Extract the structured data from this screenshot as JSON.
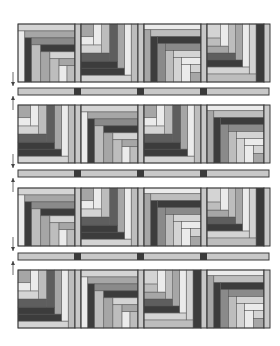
{
  "diagram": {
    "layout": {
      "rows": 4,
      "cols": 4,
      "origin_x": 18,
      "origin_y": 24,
      "block_w": 57,
      "block_h": 58,
      "side_sash_w": 6,
      "col_pitch": 63,
      "row_gap_sash_h": 7
    },
    "palette": {
      "c1": "#ebebeb",
      "c2": "#d4d4d4",
      "c3": "#bdbdbd",
      "c4": "#a6a6a6",
      "c5": "#8a8a8a",
      "c6": "#5e5e5e",
      "c7": "#3c3c3c",
      "sash": "#c8c8c8",
      "cornerstone": "#3a3a3a",
      "outline": "#3a3a3a"
    },
    "block_types": {
      "A": {
        "name": "stair-bottom-right",
        "strips": [
          [
            0,
            0,
            1,
            0.12,
            "c2"
          ],
          [
            0,
            0.12,
            0.12,
            0.88,
            "c1"
          ],
          [
            0.12,
            0.12,
            0.88,
            0.12,
            "c4"
          ],
          [
            0.12,
            0.24,
            0.12,
            0.76,
            "c7"
          ],
          [
            0.24,
            0.24,
            0.76,
            0.12,
            "c5"
          ],
          [
            0.24,
            0.36,
            0.16,
            0.64,
            "c3"
          ],
          [
            0.4,
            0.36,
            0.6,
            0.12,
            "c7"
          ],
          [
            0.4,
            0.48,
            0.16,
            0.52,
            "c4"
          ],
          [
            0.56,
            0.48,
            0.44,
            0.12,
            "c2"
          ],
          [
            0.56,
            0.6,
            0.16,
            0.4,
            "c3"
          ],
          [
            0.72,
            0.6,
            0.28,
            0.12,
            "c4"
          ],
          [
            0.72,
            0.72,
            0.14,
            0.28,
            "c1"
          ],
          [
            0.86,
            0.72,
            0.14,
            0.28,
            "c3"
          ]
        ]
      },
      "B": {
        "name": "stair-top-left",
        "strips": [
          [
            0.88,
            0,
            0.12,
            1,
            "c3"
          ],
          [
            0,
            0.88,
            0.88,
            0.12,
            "c2"
          ],
          [
            0.76,
            0,
            0.12,
            0.88,
            "c1"
          ],
          [
            0,
            0.76,
            0.76,
            0.12,
            "c7"
          ],
          [
            0.64,
            0,
            0.12,
            0.76,
            "c4"
          ],
          [
            0,
            0.64,
            0.64,
            0.12,
            "c7"
          ],
          [
            0.5,
            0,
            0.14,
            0.64,
            "c6"
          ],
          [
            0,
            0.5,
            0.5,
            0.14,
            "c6"
          ],
          [
            0.36,
            0,
            0.14,
            0.5,
            "c3"
          ],
          [
            0,
            0.36,
            0.36,
            0.14,
            "c2"
          ],
          [
            0.22,
            0,
            0.14,
            0.36,
            "c1"
          ],
          [
            0,
            0.22,
            0.22,
            0.14,
            "c1"
          ],
          [
            0,
            0,
            0.22,
            0.22,
            "c4"
          ]
        ]
      },
      "C": {
        "name": "stair-bottom-right-dark",
        "strips": [
          [
            0,
            0,
            1,
            0.1,
            "c1"
          ],
          [
            0,
            0.1,
            0.12,
            0.9,
            "c4"
          ],
          [
            0.12,
            0.1,
            0.88,
            0.12,
            "c3"
          ],
          [
            0.12,
            0.22,
            0.12,
            0.78,
            "c7"
          ],
          [
            0.24,
            0.22,
            0.76,
            0.12,
            "c7"
          ],
          [
            0.24,
            0.34,
            0.14,
            0.66,
            "c5"
          ],
          [
            0.38,
            0.34,
            0.62,
            0.12,
            "c5"
          ],
          [
            0.38,
            0.46,
            0.14,
            0.54,
            "c3"
          ],
          [
            0.52,
            0.46,
            0.48,
            0.12,
            "c2"
          ],
          [
            0.52,
            0.58,
            0.14,
            0.42,
            "c2"
          ],
          [
            0.66,
            0.58,
            0.34,
            0.12,
            "c1"
          ],
          [
            0.66,
            0.7,
            0.16,
            0.3,
            "c1"
          ],
          [
            0.82,
            0.7,
            0.18,
            0.14,
            "c2"
          ],
          [
            0.82,
            0.84,
            0.18,
            0.16,
            "c4"
          ]
        ]
      },
      "D": {
        "name": "stair-top-left-darkright",
        "strips": [
          [
            0.86,
            0,
            0.14,
            1,
            "c7"
          ],
          [
            0,
            0.86,
            0.86,
            0.14,
            "c3"
          ],
          [
            0.74,
            0,
            0.12,
            0.86,
            "c2"
          ],
          [
            0,
            0.74,
            0.74,
            0.12,
            "c2"
          ],
          [
            0.62,
            0,
            0.12,
            0.74,
            "c1"
          ],
          [
            0,
            0.62,
            0.62,
            0.12,
            "c7"
          ],
          [
            0.5,
            0,
            0.12,
            0.62,
            "c4"
          ],
          [
            0,
            0.5,
            0.5,
            0.12,
            "c6"
          ],
          [
            0.38,
            0,
            0.12,
            0.5,
            "c3"
          ],
          [
            0,
            0.38,
            0.38,
            0.12,
            "c4"
          ],
          [
            0.24,
            0,
            0.14,
            0.38,
            "c1"
          ],
          [
            0,
            0.24,
            0.24,
            0.14,
            "c3"
          ],
          [
            0,
            0,
            0.24,
            0.24,
            "c2"
          ]
        ]
      }
    },
    "rows": [
      {
        "blocks": [
          "A",
          "B",
          "C",
          "D"
        ]
      },
      {
        "blocks": [
          "B",
          "A",
          "B",
          "C"
        ]
      },
      {
        "blocks": [
          "A",
          "B",
          "C",
          "D"
        ]
      },
      {
        "blocks": [
          "B",
          "A",
          "D",
          "C"
        ]
      }
    ],
    "sashing_rows": [
      {
        "y": 88,
        "cornerstones": 3
      },
      {
        "y": 170,
        "cornerstones": 3
      },
      {
        "y": 253,
        "cornerstones": 3
      }
    ],
    "arrows": [
      {
        "y1": 72,
        "y2": 86,
        "direction": "down"
      },
      {
        "y1": 96,
        "y2": 110,
        "direction": "up"
      },
      {
        "y1": 154,
        "y2": 168,
        "direction": "down"
      },
      {
        "y1": 178,
        "y2": 192,
        "direction": "up"
      },
      {
        "y1": 237,
        "y2": 251,
        "direction": "down"
      },
      {
        "y1": 261,
        "y2": 275,
        "direction": "up"
      }
    ]
  }
}
